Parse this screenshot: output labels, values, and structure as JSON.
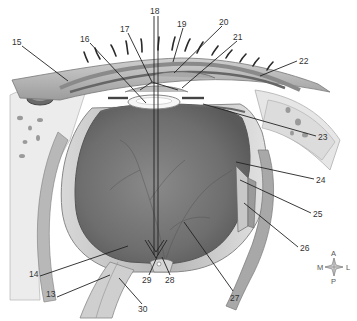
{
  "diagram": {
    "labels": [
      {
        "id": "13",
        "text": "13",
        "x": 46,
        "y": 294
      },
      {
        "id": "14",
        "text": "14",
        "x": 29,
        "y": 273
      },
      {
        "id": "15",
        "text": "15",
        "x": 12,
        "y": 38
      },
      {
        "id": "16",
        "text": "16",
        "x": 80,
        "y": 35
      },
      {
        "id": "17",
        "text": "17",
        "x": 120,
        "y": 25
      },
      {
        "id": "18",
        "text": "18",
        "x": 150,
        "y": 7
      },
      {
        "id": "19",
        "text": "19",
        "x": 177,
        "y": 20
      },
      {
        "id": "20",
        "text": "20",
        "x": 219,
        "y": 18
      },
      {
        "id": "21",
        "text": "21",
        "x": 233,
        "y": 33
      },
      {
        "id": "22",
        "text": "22",
        "x": 299,
        "y": 56
      },
      {
        "id": "23",
        "text": "23",
        "x": 318,
        "y": 133
      },
      {
        "id": "24",
        "text": "24",
        "x": 316,
        "y": 176
      },
      {
        "id": "25",
        "text": "25",
        "x": 313,
        "y": 210
      },
      {
        "id": "26",
        "text": "26",
        "x": 300,
        "y": 244
      },
      {
        "id": "27",
        "text": "27",
        "x": 230,
        "y": 294
      },
      {
        "id": "28",
        "text": "28",
        "x": 167,
        "y": 276
      },
      {
        "id": "29",
        "text": "29",
        "x": 142,
        "y": 276
      },
      {
        "id": "30",
        "text": "30",
        "x": 138,
        "y": 305
      }
    ],
    "compass": {
      "up": "A",
      "down": "P",
      "left": "M",
      "right": "L"
    }
  }
}
